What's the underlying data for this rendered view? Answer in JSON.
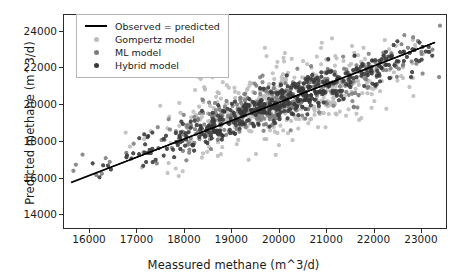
{
  "chart_data": {
    "type": "scatter",
    "title": "",
    "xlabel": "Meassured methane (m^3/d)",
    "ylabel": "Predicted methane (m^3/d)",
    "xlim": [
      15450,
      23550
    ],
    "ylim": [
      13200,
      24900
    ],
    "xticks": [
      16000,
      17000,
      18000,
      19000,
      20000,
      21000,
      22000,
      23000
    ],
    "xticklabels": [
      "16000",
      "17000",
      "18000",
      "19000",
      "20000",
      "21000",
      "22000",
      "23000"
    ],
    "yticks": [
      14000,
      16000,
      18000,
      20000,
      22000,
      24000
    ],
    "yticklabels": [
      "14000",
      "16000",
      "18000",
      "20000",
      "22000",
      "24000"
    ],
    "grid": false,
    "legend_position": "upper left",
    "reference_line": {
      "label": "Observed = predicted",
      "color": "#000000",
      "style": "solid",
      "width": 1.8,
      "slope": 1.0,
      "intercept": 0,
      "x_start": 15600,
      "y_start": 15700,
      "x_end": 23320,
      "y_end": 23400
    },
    "series": [
      {
        "name": "Gompertz model",
        "color": "#bdbdbd",
        "marker": "circle",
        "marker_size": 4.2,
        "n_points": 430,
        "seed": 10417,
        "x_mean": 20150,
        "x_sd": 1400,
        "bias_intercept": 6100,
        "bias_slope": 0.705,
        "noise_sd": 1020
      },
      {
        "name": "ML model",
        "color": "#7d7d7d",
        "marker": "circle",
        "marker_size": 4.2,
        "n_points": 360,
        "seed": 28831,
        "x_mean": 20050,
        "x_sd": 1450,
        "bias_intercept": 2450,
        "bias_slope": 0.882,
        "noise_sd": 660
      },
      {
        "name": "Hybrid model",
        "color": "#3a3a3a",
        "marker": "circle",
        "marker_size": 4.2,
        "n_points": 470,
        "seed": 51903,
        "x_mean": 20000,
        "x_sd": 1500,
        "bias_intercept": 900,
        "bias_slope": 0.957,
        "noise_sd": 470
      }
    ]
  },
  "legend": {
    "items": [
      {
        "label": "Observed = predicted",
        "key": "line",
        "color": "#000000"
      },
      {
        "label": "Gompertz model",
        "key": "dot",
        "color": "#bdbdbd"
      },
      {
        "label": "ML model",
        "key": "dot",
        "color": "#7d7d7d"
      },
      {
        "label": "Hybrid model",
        "key": "dot",
        "color": "#3a3a3a"
      }
    ]
  }
}
